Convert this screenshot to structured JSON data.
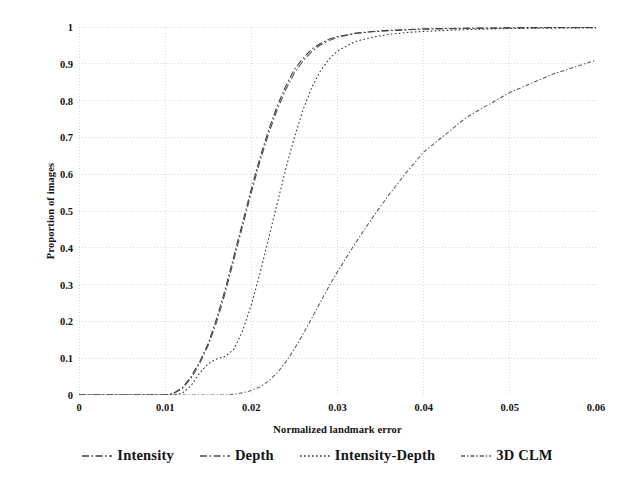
{
  "chart_data": {
    "type": "line",
    "title": "",
    "xlabel": "Normalized landmark error",
    "ylabel": "Proportion of images",
    "xlim": [
      0,
      0.06
    ],
    "ylim": [
      0,
      1
    ],
    "xticks": [
      "0",
      "0.01",
      "0.02",
      "0.03",
      "0.04",
      "0.05",
      "0.06"
    ],
    "xtick_values": [
      0,
      0.01,
      0.02,
      0.03,
      0.04,
      0.05,
      0.06
    ],
    "yticks": [
      "0",
      "0.1",
      "0.2",
      "0.3",
      "0.4",
      "0.5",
      "0.6",
      "0.7",
      "0.8",
      "0.9",
      "1"
    ],
    "ytick_values": [
      0,
      0.1,
      0.2,
      0.3,
      0.4,
      0.5,
      0.6,
      0.7,
      0.8,
      0.9,
      1
    ],
    "grid": true,
    "grid_style": "dotted",
    "grid_color": "#d8d8d8",
    "legend_position": "bottom",
    "x": [
      0.0,
      0.01,
      0.011,
      0.012,
      0.013,
      0.014,
      0.015,
      0.016,
      0.017,
      0.018,
      0.019,
      0.02,
      0.021,
      0.022,
      0.023,
      0.024,
      0.025,
      0.026,
      0.027,
      0.028,
      0.029,
      0.03,
      0.032,
      0.034,
      0.036,
      0.038,
      0.04,
      0.045,
      0.05,
      0.055,
      0.06
    ],
    "series": [
      {
        "name": "Intensity",
        "dash": "dash-dot",
        "color": "#3b3b3b",
        "values": [
          0.0,
          0.0,
          0.005,
          0.02,
          0.05,
          0.09,
          0.14,
          0.21,
          0.29,
          0.38,
          0.47,
          0.56,
          0.645,
          0.72,
          0.785,
          0.84,
          0.885,
          0.915,
          0.94,
          0.955,
          0.967,
          0.974,
          0.983,
          0.988,
          0.991,
          0.993,
          0.995,
          0.997,
          0.998,
          0.999,
          0.999
        ]
      },
      {
        "name": "Depth",
        "dash": "dash-dot",
        "color": "#4a4a4a",
        "values": [
          0.0,
          0.0,
          0.004,
          0.018,
          0.045,
          0.085,
          0.135,
          0.2,
          0.28,
          0.37,
          0.46,
          0.55,
          0.635,
          0.71,
          0.775,
          0.83,
          0.875,
          0.908,
          0.933,
          0.951,
          0.963,
          0.972,
          0.982,
          0.987,
          0.99,
          0.992,
          0.994,
          0.996,
          0.997,
          0.998,
          0.998
        ]
      },
      {
        "name": "Intensity-Depth",
        "dash": "dotted",
        "color": "#2e2e2e",
        "values": [
          0.0,
          0.0,
          0.0,
          0.005,
          0.025,
          0.06,
          0.085,
          0.098,
          0.105,
          0.125,
          0.175,
          0.245,
          0.33,
          0.425,
          0.52,
          0.615,
          0.7,
          0.775,
          0.835,
          0.88,
          0.912,
          0.935,
          0.96,
          0.972,
          0.98,
          0.985,
          0.988,
          0.993,
          0.996,
          0.997,
          0.998
        ]
      },
      {
        "name": "3D CLM",
        "dash": "dash-dot-fine",
        "color": "#5a5a5a",
        "values": [
          0.0,
          0.0,
          0.0,
          0.0,
          0.0,
          0.0,
          0.0,
          0.0,
          0.0,
          0.002,
          0.006,
          0.012,
          0.022,
          0.038,
          0.06,
          0.09,
          0.125,
          0.165,
          0.208,
          0.252,
          0.295,
          0.335,
          0.41,
          0.48,
          0.545,
          0.605,
          0.66,
          0.755,
          0.822,
          0.872,
          0.91
        ]
      }
    ]
  }
}
